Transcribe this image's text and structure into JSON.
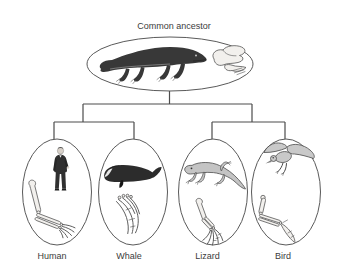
{
  "figure": {
    "root": {
      "label": "Common ancestor"
    },
    "descendants": [
      {
        "label": "Human"
      },
      {
        "label": "Whale"
      },
      {
        "label": "Lizard"
      },
      {
        "label": "Bird"
      }
    ],
    "illustrations": {
      "common_ancestor": [
        "early-tetrapod",
        "fossil-forelimb"
      ],
      "human": [
        "standing-man",
        "arm-skeleton"
      ],
      "whale": [
        "whale",
        "flipper-skeleton"
      ],
      "lizard": [
        "lizard",
        "forelimb-skeleton"
      ],
      "bird": [
        "flying-bird",
        "wing-skeleton"
      ]
    },
    "colors": {
      "background": "#ffffff",
      "connector_line": "#4c4c4c",
      "ellipse_stroke": "#5a5a5a",
      "dark_illustration": "#333333",
      "light_illustration": "#c4c4c4",
      "bone_fill": "#f2f0ed",
      "label_text": "#3c3c3c"
    }
  }
}
